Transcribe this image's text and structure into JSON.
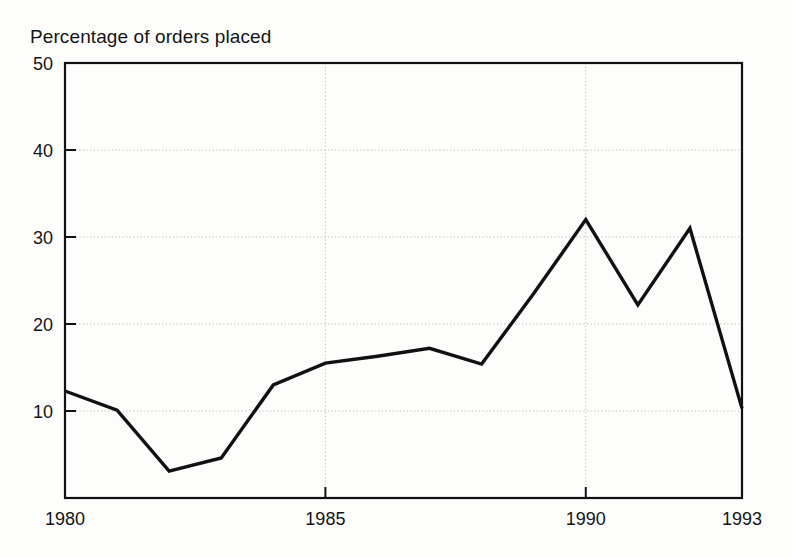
{
  "chart_data": {
    "type": "line",
    "title": "Percentage of orders placed",
    "xlabel": "",
    "ylabel": "",
    "x": [
      1980,
      1981,
      1982,
      1983,
      1984,
      1985,
      1986,
      1987,
      1988,
      1989,
      1990,
      1991,
      1992,
      1993
    ],
    "values": [
      12.3,
      10.1,
      3.1,
      4.6,
      13.0,
      15.5,
      16.3,
      17.2,
      15.4,
      23.5,
      32.0,
      22.2,
      31.0,
      10.3
    ],
    "series": [
      {
        "name": "Percentage of orders placed",
        "values": [
          12.3,
          10.1,
          3.1,
          4.6,
          13.0,
          15.5,
          16.3,
          17.2,
          15.4,
          23.5,
          32.0,
          22.2,
          31.0,
          10.3
        ]
      }
    ],
    "xlim": [
      1980,
      1993
    ],
    "ylim": [
      0,
      50
    ],
    "yticks": [
      10,
      20,
      30,
      40,
      50
    ],
    "ytick_labels": [
      "10",
      "20",
      "30",
      "40",
      "50"
    ],
    "xticks": [
      1980,
      1985,
      1990,
      1993
    ],
    "xtick_labels": [
      "1980",
      "1985",
      "1990",
      "1993"
    ],
    "grid": true,
    "grid_style": "dotted",
    "legend": null,
    "legend_position": "none",
    "line_color": "#111111",
    "grid_color": "#b8b8b8",
    "axis_color": "#111111",
    "background_color": "#fdfdfc"
  }
}
